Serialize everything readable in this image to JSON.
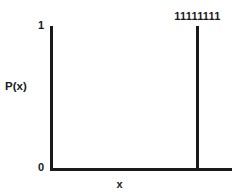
{
  "chart_data": {
    "type": "bar",
    "title": "",
    "subtitle": "",
    "xlabel": "x",
    "ylabel": "P(x)",
    "categories": [
      "11111111"
    ],
    "values": [
      1
    ],
    "ylim": [
      0,
      1
    ],
    "ytick_labels": [
      "0",
      "1"
    ],
    "ytick_values": [
      0,
      1
    ],
    "xtick_labels": [],
    "grid": false,
    "legend": null,
    "annotations": [
      {
        "text": "11111111",
        "position": "above-spike"
      }
    ],
    "style": {
      "background": "#ffffff",
      "axis_color": "#191919",
      "bar_color": "#191919",
      "text_color": "#1a1a1a"
    }
  },
  "axes": {
    "y_tick_max_label": "1",
    "y_tick_min_label": "0",
    "y_title": "P(x)",
    "x_title": "x"
  },
  "spike": {
    "label": "11111111",
    "value": 1
  }
}
